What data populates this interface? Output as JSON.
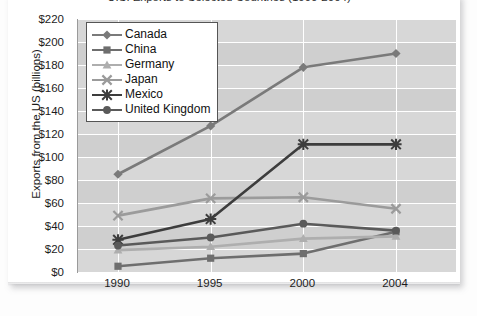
{
  "card": {
    "title": "U.S. Exports to Selected Countries (1990-2004)"
  },
  "chart_data": {
    "type": "line",
    "title": "U.S. Exports to Selected Countries (1990-2004)",
    "xlabel": "",
    "ylabel": "Exports from the US (billions)",
    "categories": [
      "1990",
      "1995",
      "2000",
      "2004"
    ],
    "x": [
      1990,
      1995,
      2000,
      2004
    ],
    "ylim": [
      0,
      220
    ],
    "ytick_labels": [
      "$220",
      "$200",
      "$180",
      "$160",
      "$140",
      "$120",
      "$100",
      "$80",
      "$60",
      "$40",
      "$20",
      "$0"
    ],
    "ytick_values": [
      220,
      200,
      180,
      160,
      140,
      120,
      100,
      80,
      60,
      40,
      20,
      0
    ],
    "grid": true,
    "legend_position": "top-left",
    "series": [
      {
        "name": "Canada",
        "marker": "diamond",
        "color": "#7a7a7a",
        "values": [
          85,
          127,
          178,
          190
        ]
      },
      {
        "name": "China",
        "marker": "square",
        "color": "#6e6e6e",
        "values": [
          5,
          12,
          16,
          35
        ]
      },
      {
        "name": "Germany",
        "marker": "triangle",
        "color": "#aeaeae",
        "values": [
          19,
          22,
          29,
          31
        ]
      },
      {
        "name": "Japan",
        "marker": "x",
        "color": "#9b9b9b",
        "values": [
          49,
          64,
          65,
          55
        ]
      },
      {
        "name": "Mexico",
        "marker": "asterisk",
        "color": "#3d3d3d",
        "values": [
          28,
          46,
          111,
          111
        ]
      },
      {
        "name": "United Kingdom",
        "marker": "circle",
        "color": "#5a5a5a",
        "values": [
          23,
          30,
          42,
          36
        ]
      }
    ]
  }
}
